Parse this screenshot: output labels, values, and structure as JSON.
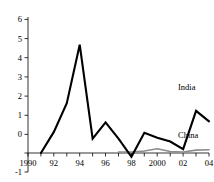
{
  "chart_data": {
    "type": "line",
    "title": "",
    "xlabel": "",
    "ylabel": "",
    "xlim": [
      1990,
      2004
    ],
    "ylim": [
      -1,
      6
    ],
    "grid": false,
    "legend_position": "inline-right",
    "x": [
      1990,
      1991,
      1992,
      1993,
      1994,
      1995,
      1996,
      1997,
      1998,
      1999,
      2000,
      2001,
      2002,
      2003,
      2004
    ],
    "x_tick_labels": [
      "1990",
      "",
      "92",
      "",
      "94",
      "",
      "96",
      "",
      "98",
      "",
      "2000",
      "",
      "02",
      "",
      "04"
    ],
    "y_tick_labels": [
      "-1",
      "0",
      "1",
      "2",
      "3",
      "4",
      "5",
      "6"
    ],
    "y_ticks": [
      -1,
      0,
      1,
      2,
      3,
      4,
      5,
      6
    ],
    "series": [
      {
        "name": "India",
        "color": "#000000",
        "x": [
          1991,
          1992,
          1993,
          1994,
          1995,
          1996,
          1997,
          1998,
          1999,
          2000,
          2001,
          2002,
          2003,
          2004
        ],
        "values": [
          0.0,
          1.1,
          2.6,
          5.65,
          0.75,
          1.6,
          0.75,
          -0.2,
          1.05,
          0.8,
          0.6,
          0.2,
          2.2,
          1.65
        ]
      },
      {
        "name": "China",
        "color": "#8c8c8c",
        "x": [
          1997,
          1998,
          1999,
          2000,
          2001,
          2002,
          2003,
          2004
        ],
        "values": [
          0.05,
          0.05,
          0.1,
          0.22,
          0.08,
          0.05,
          0.15,
          0.17
        ]
      }
    ],
    "annotations": [
      {
        "text": "India",
        "x": 2003,
        "y": 2.95
      },
      {
        "text": "China",
        "x": 2003,
        "y": 0.68
      }
    ]
  }
}
